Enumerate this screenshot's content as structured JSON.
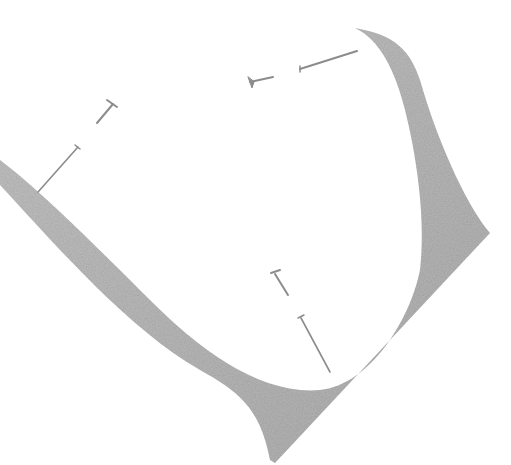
{
  "image": {
    "description": "Pencil sketch of a curled paper corner pinned with nails",
    "background": "#ffffff",
    "shade_color": "#a9a9a9",
    "nail_color": "#8c8c8c",
    "nail_count": 6
  }
}
